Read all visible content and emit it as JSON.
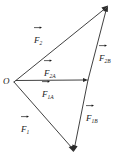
{
  "figure": {
    "kind": "vector-decomposition-diagram",
    "width": 120,
    "height": 163,
    "background_color": "#ffffff",
    "stroke_color": "#2b2b2b",
    "text_color": "#1a1a1a",
    "origin_label": "O",
    "points": {
      "origin": {
        "name": "O",
        "x": 14,
        "y": 82
      },
      "upper_apex": {
        "name": "F2 tip",
        "x": 108,
        "y": 6
      },
      "lower_apex": {
        "name": "F1 tip",
        "x": 73,
        "y": 152
      },
      "a_component": {
        "name": "A tip",
        "x": 88,
        "y": 80
      }
    },
    "vectors": [
      {
        "id": "F2",
        "symbol": "F",
        "subscript": "2",
        "label": "F2",
        "from": "origin",
        "to": "upper_apex",
        "arrowhead": true,
        "label_x": 34,
        "label_y": 30
      },
      {
        "id": "F1",
        "symbol": "F",
        "subscript": "1",
        "label": "F1",
        "from": "origin",
        "to": "lower_apex",
        "arrowhead": true,
        "label_x": 21,
        "label_y": 119
      },
      {
        "id": "F2A",
        "symbol": "F",
        "subscript": "2A",
        "label": "F2A",
        "from": "origin",
        "to": "a_component",
        "arrowhead": true,
        "label_x": 44,
        "label_y": 63
      },
      {
        "id": "F1A",
        "symbol": "F",
        "subscript": "1A",
        "label": "F1A",
        "from": "origin",
        "to": "a_component",
        "arrowhead": false,
        "label_x": 42,
        "label_y": 84
      },
      {
        "id": "F2B",
        "symbol": "F",
        "subscript": "2B",
        "label": "F2B",
        "from": "a_component",
        "to": "upper_apex",
        "arrowhead": true,
        "label_x": 99,
        "label_y": 48
      },
      {
        "id": "F1B",
        "symbol": "F",
        "subscript": "1B",
        "label": "F1B",
        "from": "a_component",
        "to": "lower_apex",
        "arrowhead": true,
        "label_x": 86,
        "label_y": 108
      }
    ]
  }
}
